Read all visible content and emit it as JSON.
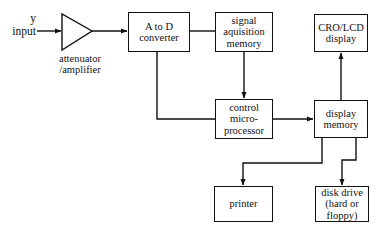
{
  "diagram": {
    "stroke_color": "#111111",
    "background_color": "#ffffff",
    "input_label": "y\ninput",
    "amplifier_caption": "attenuator\n/amplifier",
    "blocks": [
      {
        "id": "adc",
        "label": "A to D\nconverter"
      },
      {
        "id": "sig_mem",
        "label": "signal\naquisition\nmemory"
      },
      {
        "id": "cro",
        "label": "CRO/LCD\ndisplay"
      },
      {
        "id": "control_mpu",
        "label": "control\nmicro-\nprocessor"
      },
      {
        "id": "disp_mem",
        "label": "display\nmemory"
      },
      {
        "id": "printer",
        "label": "printer"
      },
      {
        "id": "disk",
        "label": "disk drive\n(hard or\nfloppy)"
      }
    ],
    "connections": [
      {
        "from": "y input",
        "to": "attenuator/amplifier",
        "arrow": true
      },
      {
        "from": "attenuator/amplifier",
        "to": "A to D converter",
        "arrow": true
      },
      {
        "from": "A to D converter",
        "to": "signal aquisition memory",
        "arrow": false
      },
      {
        "from": "signal aquisition memory",
        "to": "control micro-processor",
        "arrow": true
      },
      {
        "from": "A to D converter",
        "to": "control micro-processor",
        "arrow": false
      },
      {
        "from": "control micro-processor",
        "to": "display memory",
        "arrow": true
      },
      {
        "from": "display memory",
        "to": "CRO/LCD display",
        "arrow": true
      },
      {
        "from": "display memory",
        "to": "printer",
        "arrow": true
      },
      {
        "from": "display memory",
        "to": "disk drive (hard or floppy)",
        "arrow": true
      }
    ]
  }
}
